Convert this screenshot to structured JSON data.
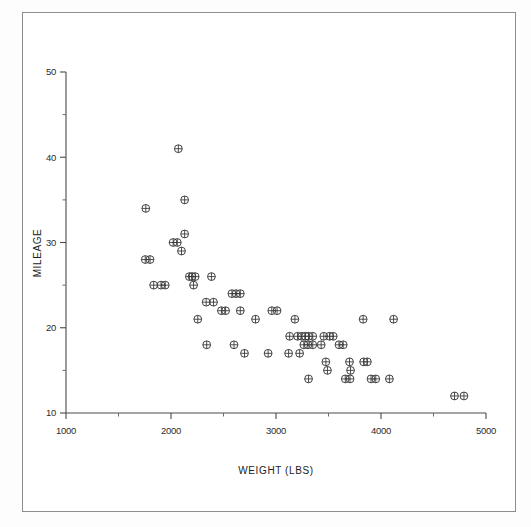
{
  "chart_data": {
    "type": "scatter",
    "title": "",
    "xlabel": "WEIGHT (LBS)",
    "ylabel": "MILEAGE",
    "xlim": [
      1000,
      5000
    ],
    "ylim": [
      10,
      50
    ],
    "x_ticks": [
      1000,
      2000,
      3000,
      4000,
      5000
    ],
    "x_tick_labels": [
      "1000",
      "2000",
      "3000",
      "4000",
      "5000"
    ],
    "x_minor_ticks": [
      1500,
      2500,
      3500,
      4500
    ],
    "y_ticks": [
      10,
      20,
      30,
      40,
      50
    ],
    "y_tick_labels": [
      "10",
      "20",
      "30",
      "40",
      "50"
    ],
    "y_minor_ticks": [
      15,
      25,
      35,
      45
    ],
    "grid": false,
    "legend": false,
    "marker": "circle-plus",
    "marker_color": "#3a3a3a",
    "points": [
      {
        "x": 1760,
        "y": 34
      },
      {
        "x": 2070,
        "y": 41
      },
      {
        "x": 2130,
        "y": 35
      },
      {
        "x": 2130,
        "y": 31
      },
      {
        "x": 1800,
        "y": 28
      },
      {
        "x": 1755,
        "y": 28
      },
      {
        "x": 2020,
        "y": 30
      },
      {
        "x": 2060,
        "y": 30
      },
      {
        "x": 2100,
        "y": 29
      },
      {
        "x": 1835,
        "y": 25
      },
      {
        "x": 1905,
        "y": 25
      },
      {
        "x": 1945,
        "y": 25
      },
      {
        "x": 2175,
        "y": 26
      },
      {
        "x": 2200,
        "y": 26
      },
      {
        "x": 2230,
        "y": 26
      },
      {
        "x": 2215,
        "y": 25
      },
      {
        "x": 2385,
        "y": 26
      },
      {
        "x": 2335,
        "y": 23
      },
      {
        "x": 2405,
        "y": 23
      },
      {
        "x": 2255,
        "y": 21
      },
      {
        "x": 2580,
        "y": 24
      },
      {
        "x": 2620,
        "y": 24
      },
      {
        "x": 2660,
        "y": 24
      },
      {
        "x": 2660,
        "y": 22
      },
      {
        "x": 2480,
        "y": 22
      },
      {
        "x": 2520,
        "y": 22
      },
      {
        "x": 2340,
        "y": 18
      },
      {
        "x": 2600,
        "y": 18
      },
      {
        "x": 2700,
        "y": 17
      },
      {
        "x": 2805,
        "y": 21
      },
      {
        "x": 2960,
        "y": 22
      },
      {
        "x": 3010,
        "y": 22
      },
      {
        "x": 2925,
        "y": 17
      },
      {
        "x": 3130,
        "y": 19
      },
      {
        "x": 3180,
        "y": 21
      },
      {
        "x": 3205,
        "y": 19
      },
      {
        "x": 3245,
        "y": 19
      },
      {
        "x": 3280,
        "y": 19
      },
      {
        "x": 3310,
        "y": 19
      },
      {
        "x": 3350,
        "y": 19
      },
      {
        "x": 3265,
        "y": 18
      },
      {
        "x": 3305,
        "y": 18
      },
      {
        "x": 3350,
        "y": 18
      },
      {
        "x": 3120,
        "y": 17
      },
      {
        "x": 3225,
        "y": 17
      },
      {
        "x": 3455,
        "y": 19
      },
      {
        "x": 3510,
        "y": 19
      },
      {
        "x": 3545,
        "y": 19
      },
      {
        "x": 3430,
        "y": 18
      },
      {
        "x": 3600,
        "y": 18
      },
      {
        "x": 3640,
        "y": 18
      },
      {
        "x": 3475,
        "y": 16
      },
      {
        "x": 3490,
        "y": 15
      },
      {
        "x": 3310,
        "y": 14
      },
      {
        "x": 3700,
        "y": 16
      },
      {
        "x": 3710,
        "y": 15
      },
      {
        "x": 3835,
        "y": 16
      },
      {
        "x": 3870,
        "y": 16
      },
      {
        "x": 3660,
        "y": 14
      },
      {
        "x": 3705,
        "y": 14
      },
      {
        "x": 3830,
        "y": 21
      },
      {
        "x": 4120,
        "y": 21
      },
      {
        "x": 3905,
        "y": 14
      },
      {
        "x": 3950,
        "y": 14
      },
      {
        "x": 4080,
        "y": 14
      },
      {
        "x": 4700,
        "y": 12
      },
      {
        "x": 4790,
        "y": 12
      }
    ]
  }
}
